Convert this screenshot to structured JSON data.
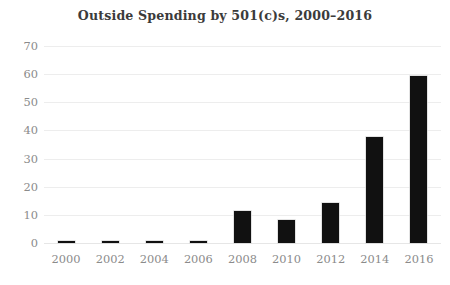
{
  "chart_data": {
    "type": "bar",
    "title": "Outside Spending by 501(c)s, 2000–2016",
    "subtitle": "",
    "xlabel": "",
    "ylabel": "",
    "categories": [
      "2000",
      "2002",
      "2004",
      "2006",
      "2008",
      "2010",
      "2012",
      "2014",
      "2016"
    ],
    "values": [
      0.6,
      0.6,
      0.6,
      0.7,
      11.4,
      8.2,
      14.2,
      37.7,
      59.5
    ],
    "series": [
      {
        "name": "Outside Spending by 501(c)s",
        "values": [
          0.6,
          0.6,
          0.6,
          0.7,
          11.4,
          8.2,
          14.2,
          37.7,
          59.5
        ]
      }
    ],
    "ylim": [
      0,
      70
    ],
    "yticks": [
      0,
      10,
      20,
      30,
      40,
      50,
      60,
      70
    ],
    "ytick_labels": [
      "0",
      "10",
      "20",
      "30",
      "40",
      "50",
      "60",
      "70"
    ],
    "xtick_labels": [
      "2000",
      "2002",
      "2004",
      "2006",
      "2008",
      "2010",
      "2012",
      "2014",
      "2016"
    ],
    "grid": "horizontal",
    "legend": "none",
    "bar_color": "#111111",
    "gridline_color": "#ededed",
    "tick_label_color": "#8b8b8b",
    "title_color": "#3b3b3b",
    "background_color": "#ffffff"
  }
}
